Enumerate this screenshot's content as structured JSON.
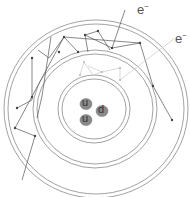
{
  "diagram": {
    "title": "",
    "labels": {
      "electron_1": "e",
      "electron_2": "e",
      "charge": "−"
    },
    "quarks": [
      {
        "name": "u",
        "cx": 86,
        "cy": 104
      },
      {
        "name": "d",
        "cx": 102,
        "cy": 111
      },
      {
        "name": "u",
        "cx": 86,
        "cy": 120
      }
    ],
    "colors": {
      "ring": "#888888",
      "path_dark": "#555555",
      "path_light": "#c8c8c8",
      "quark_fill": "#8a8a8a",
      "quark_text": "#333333"
    }
  }
}
